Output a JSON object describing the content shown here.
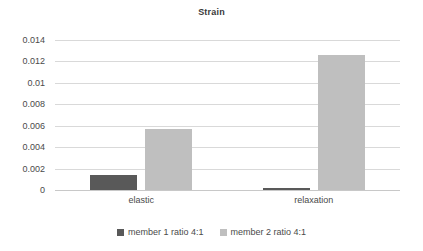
{
  "chart_data": {
    "type": "bar",
    "title": "Strain",
    "xlabel": "",
    "ylabel": "",
    "categories": [
      "elastic",
      "relaxation"
    ],
    "series": [
      {
        "name": "member 1 ratio 4:1",
        "color": "#595959",
        "values": [
          0.0014,
          0.0002
        ]
      },
      {
        "name": "member 2 ratio 4:1",
        "color": "#bfbfbf",
        "values": [
          0.0057,
          0.0126
        ]
      }
    ],
    "ylim": [
      0,
      0.014
    ],
    "yticks": [
      0,
      0.002,
      0.004,
      0.006,
      0.008,
      0.01,
      0.012,
      0.014
    ],
    "ytick_labels": [
      "0",
      "0.002",
      "0.004",
      "0.006",
      "0.008",
      "0.01",
      "0.012",
      "0.014"
    ],
    "grid": true,
    "legend_position": "bottom"
  },
  "colors": {
    "gridline": "#d9d9d9",
    "axis": "#c8c8c8",
    "text": "#4a4a4a",
    "title": "#3a3a3a",
    "background": "#ffffff"
  }
}
